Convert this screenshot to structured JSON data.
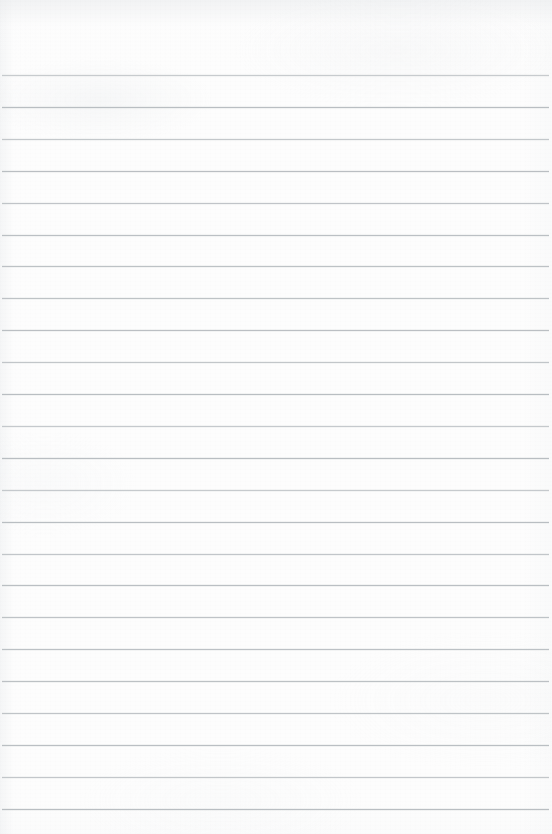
{
  "document": {
    "kind": "scanned-lined-paper",
    "title": "Blank Ruled Notebook Page",
    "content_text": "",
    "page_width": 552,
    "page_height": 834,
    "has_written_content": false,
    "has_printed_text": false,
    "has_margin_rule": false,
    "has_holes": false
  },
  "colors": {
    "paper": "#fdfdfd",
    "rule_line": "#b9bec3",
    "edge_shadow": "#e8eaec"
  },
  "ruling": {
    "style": "wide-ruled-horizontal",
    "line_count": 24,
    "first_line_y": 75,
    "line_spacing": 31.9,
    "line_thickness": 1,
    "line_left_x": 2,
    "line_right_x": 549,
    "lines_y": [
      75.0,
      106.9,
      138.8,
      170.7,
      202.6,
      234.5,
      266.4,
      298.3,
      330.2,
      362.1,
      394.0,
      425.9,
      457.8,
      489.7,
      521.6,
      553.5,
      585.4,
      617.3,
      649.2,
      681.1,
      713.0,
      744.9,
      776.8,
      808.7
    ]
  },
  "margins": {
    "top_blank_height": 75,
    "bottom_blank_height": 25,
    "left_inset": 2,
    "right_inset": 3
  }
}
